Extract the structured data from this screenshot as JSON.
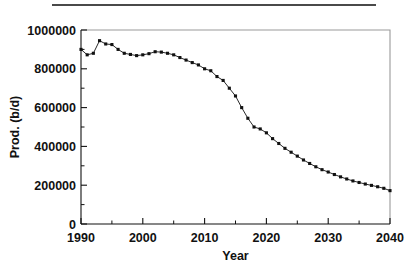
{
  "figure": {
    "top_rule": "horizontal-rule",
    "background_color": "#ffffff",
    "ink_color": "#111111"
  },
  "chart_data": {
    "type": "line",
    "title": "",
    "subtitle": "",
    "xlabel": "Year",
    "ylabel": "Prod. (b/d)",
    "xlim": [
      1990,
      2040
    ],
    "ylim": [
      0,
      1000000
    ],
    "grid": false,
    "legend": null,
    "legend_position": "none",
    "marker": "square",
    "marker_color": "#111111",
    "line_color": "#111111",
    "x_major_ticks": [
      1990,
      2000,
      2010,
      2020,
      2030,
      2040
    ],
    "x_major_tick_labels": [
      "1990",
      "2000",
      "2010",
      "2020",
      "2030",
      "2040"
    ],
    "x_minor_ticks": [
      1995,
      2005,
      2015,
      2025,
      2035
    ],
    "y_major_ticks": [
      0,
      200000,
      400000,
      600000,
      800000,
      1000000
    ],
    "y_major_tick_labels": [
      "0",
      "200000",
      "400000",
      "600000",
      "800000",
      "1000000"
    ],
    "y_minor_ticks": [
      100000,
      300000,
      500000,
      700000,
      900000
    ],
    "x": [
      1990,
      1991,
      1992,
      1993,
      1994,
      1995,
      1996,
      1997,
      1998,
      1999,
      2000,
      2001,
      2002,
      2003,
      2004,
      2005,
      2006,
      2007,
      2008,
      2009,
      2010,
      2011,
      2012,
      2013,
      2014,
      2015,
      2016,
      2017,
      2018,
      2019,
      2020,
      2021,
      2022,
      2023,
      2024,
      2025,
      2026,
      2027,
      2028,
      2029,
      2030,
      2031,
      2032,
      2033,
      2034,
      2035,
      2036,
      2037,
      2038,
      2039,
      2040
    ],
    "values": [
      900000,
      872000,
      880000,
      945000,
      928000,
      925000,
      900000,
      880000,
      874000,
      868000,
      872000,
      878000,
      888000,
      886000,
      880000,
      872000,
      858000,
      845000,
      832000,
      820000,
      800000,
      790000,
      760000,
      740000,
      700000,
      660000,
      600000,
      545000,
      500000,
      490000,
      470000,
      440000,
      415000,
      390000,
      370000,
      350000,
      330000,
      312000,
      295000,
      280000,
      268000,
      255000,
      243000,
      232000,
      222000,
      214000,
      206000,
      199000,
      192000,
      184000,
      172000
    ],
    "series": [
      {
        "name": "Production",
        "values": [
          900000,
          872000,
          880000,
          945000,
          928000,
          925000,
          900000,
          880000,
          874000,
          868000,
          872000,
          878000,
          888000,
          886000,
          880000,
          872000,
          858000,
          845000,
          832000,
          820000,
          800000,
          790000,
          760000,
          740000,
          700000,
          660000,
          600000,
          545000,
          500000,
          490000,
          470000,
          440000,
          415000,
          390000,
          370000,
          350000,
          330000,
          312000,
          295000,
          280000,
          268000,
          255000,
          243000,
          232000,
          222000,
          214000,
          206000,
          199000,
          192000,
          184000,
          172000
        ]
      }
    ]
  }
}
